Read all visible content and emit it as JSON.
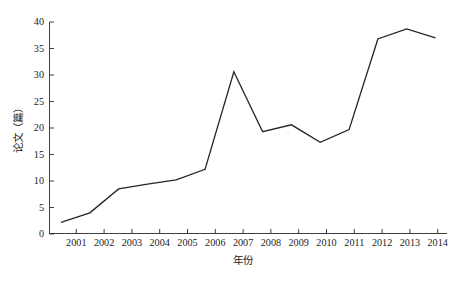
{
  "chart_data": {
    "type": "line",
    "title": "",
    "xlabel": "年份",
    "ylabel": "论文（篇）",
    "categories": [
      "2001",
      "2002",
      "2003",
      "2004",
      "2005",
      "2006",
      "2007",
      "2008",
      "2009",
      "2010",
      "2011",
      "2012",
      "2013",
      "2014"
    ],
    "x": [
      2001,
      2002,
      2003,
      2004,
      2005,
      2006,
      2007,
      2008,
      2009,
      2010,
      2011,
      2012,
      2013,
      2014
    ],
    "values": [
      2.2,
      4.0,
      8.5,
      9.4,
      10.2,
      12.2,
      30.6,
      19.3,
      20.6,
      17.3,
      19.7,
      36.8,
      38.7,
      37.0
    ],
    "series": [
      {
        "name": "论文（篇）",
        "values": [
          2.2,
          4.0,
          8.5,
          9.4,
          10.2,
          12.2,
          30.6,
          19.3,
          20.6,
          17.3,
          19.7,
          36.8,
          38.7,
          37.0
        ]
      }
    ],
    "xlim": [
      2000.6,
      2014.4
    ],
    "ylim": [
      0,
      40
    ],
    "yticks": [
      0,
      5,
      10,
      15,
      20,
      25,
      30,
      35,
      40
    ],
    "ytick_labels": [
      "0",
      "5",
      "10",
      "15",
      "20",
      "25",
      "30",
      "35",
      "40"
    ],
    "xtick_labels": [
      "2001",
      "2002",
      "2003",
      "2004",
      "2005",
      "2006",
      "2007",
      "2008",
      "2009",
      "2010",
      "2011",
      "2012",
      "2013",
      "2014"
    ],
    "grid": false,
    "legend": false,
    "legend_position": "none",
    "line_color": "#262626",
    "background_color": "#ffffff",
    "axis_color": "#2a2a2a"
  },
  "axis": {
    "y_tick_0": "0",
    "y_tick_1": "5",
    "y_tick_2": "10",
    "y_tick_3": "15",
    "y_tick_4": "20",
    "y_tick_5": "25",
    "y_tick_6": "30",
    "y_tick_7": "35",
    "y_tick_8": "40",
    "x_tick_0": "2001",
    "x_tick_1": "2002",
    "x_tick_2": "2003",
    "x_tick_3": "2004",
    "x_tick_4": "2005",
    "x_tick_5": "2006",
    "x_tick_6": "2007",
    "x_tick_7": "2008",
    "x_tick_8": "2009",
    "x_tick_9": "2010",
    "x_tick_10": "2011",
    "x_tick_11": "2012",
    "x_tick_12": "2013",
    "x_tick_13": "2014",
    "x_title": "年份",
    "y_title": "论文（篇）"
  }
}
